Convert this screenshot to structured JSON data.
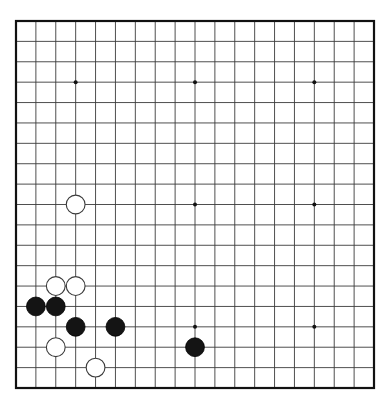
{
  "board": {
    "title": "Go board position",
    "size": 19,
    "geometry": {
      "left": 16,
      "top": 21,
      "right": 374,
      "bottom": 388,
      "cell_w": 19.889,
      "cell_h": 20.389,
      "stone_radius": 9.4,
      "border_width": 2.2,
      "grid_line_width": 0.9
    },
    "colors": {
      "background": "#ffffff",
      "grid_line": "#3b3b3b",
      "border": "#111111",
      "black_stone_fill": "#141414",
      "black_stone_edge": "#000000",
      "white_stone_fill": "#ffffff",
      "white_stone_edge": "#3a3a3a",
      "star_point": "#111111"
    },
    "star_points": [
      {
        "col": 3,
        "row": 3
      },
      {
        "col": 9,
        "row": 3
      },
      {
        "col": 15,
        "row": 3
      },
      {
        "col": 3,
        "row": 9
      },
      {
        "col": 9,
        "row": 9
      },
      {
        "col": 15,
        "row": 9
      },
      {
        "col": 3,
        "row": 15
      },
      {
        "col": 9,
        "row": 15
      },
      {
        "col": 15,
        "row": 15
      }
    ],
    "star_point_radius": 2.0,
    "stones": [
      {
        "color": "white",
        "col": 3,
        "row": 9
      },
      {
        "color": "white",
        "col": 2,
        "row": 13
      },
      {
        "color": "white",
        "col": 3,
        "row": 13
      },
      {
        "color": "black",
        "col": 1,
        "row": 14
      },
      {
        "color": "black",
        "col": 2,
        "row": 14
      },
      {
        "color": "black",
        "col": 3,
        "row": 15
      },
      {
        "color": "black",
        "col": 5,
        "row": 15
      },
      {
        "color": "white",
        "col": 2,
        "row": 16
      },
      {
        "color": "black",
        "col": 9,
        "row": 16
      },
      {
        "color": "white",
        "col": 4,
        "row": 17
      }
    ],
    "counts": {
      "black_stones": 5,
      "white_stones": 5,
      "total_stones": 10
    }
  }
}
